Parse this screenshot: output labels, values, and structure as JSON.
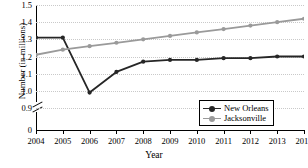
{
  "chart_data": {
    "type": "line",
    "title": "",
    "xlabel": "Year",
    "ylabel": "Number (in millions)",
    "categories": [
      "2004",
      "2005",
      "2006",
      "2007",
      "2008",
      "2009",
      "2010",
      "2011",
      "2012",
      "2013",
      "2014"
    ],
    "x": [
      2004,
      2005,
      2006,
      2007,
      2008,
      2009,
      2010,
      2011,
      2012,
      2013,
      2014
    ],
    "xlim": [
      2004,
      2014
    ],
    "ylim": [
      0.9,
      1.5
    ],
    "yticks": [
      "0",
      "0.9",
      "1.0",
      "1.1",
      "1.2",
      "1.3",
      "1.4",
      "1.5"
    ],
    "y_axis_break": true,
    "y_axis_break_between": [
      0,
      0.9
    ],
    "grid": true,
    "grid_style": "dotted-horizontal",
    "legend_position": "bottom-right",
    "series": [
      {
        "name": "New Orleans",
        "color": "#262626",
        "marker": "circle",
        "values": [
          1.31,
          1.31,
          0.99,
          1.11,
          1.17,
          1.18,
          1.18,
          1.19,
          1.19,
          1.2,
          1.2
        ]
      },
      {
        "name": "Jacksonville",
        "color": "#9a9a9a",
        "marker": "circle",
        "values": [
          1.21,
          1.24,
          1.26,
          1.28,
          1.3,
          1.32,
          1.34,
          1.36,
          1.38,
          1.4,
          1.42
        ]
      }
    ]
  },
  "axis": {
    "ylabel": "Number (in millions)",
    "xlabel": "Year"
  },
  "legend": {
    "items": [
      {
        "label": "New Orleans"
      },
      {
        "label": "Jacksonville"
      }
    ]
  },
  "colors": {
    "series_new_orleans": "#262626",
    "series_jacksonville": "#9a9a9a",
    "grid": "#c9c9c9",
    "axis": "#000000",
    "background": "#ffffff"
  }
}
